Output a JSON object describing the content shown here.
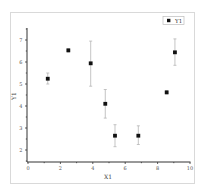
{
  "chart_data": {
    "type": "scatter",
    "title": "",
    "xlabel": "X1",
    "ylabel": "Y1",
    "xlim": [
      0,
      10
    ],
    "ylim": [
      1.5,
      7.5
    ],
    "xticks": [
      0,
      2,
      4,
      6,
      8,
      10
    ],
    "yticks": [
      2,
      3,
      4,
      5,
      6,
      7
    ],
    "grid": false,
    "legend_position": "top-right",
    "series": [
      {
        "name": "Y1",
        "marker": "square",
        "color": "#111111",
        "error_bar_color": "#b5b5b5",
        "points": [
          {
            "x": 1.22,
            "y": 5.24,
            "err_low": 5.0,
            "err_high": 5.5
          },
          {
            "x": 2.49,
            "y": 6.53,
            "err_low": 6.45,
            "err_high": 6.6
          },
          {
            "x": 3.87,
            "y": 5.94,
            "err_low": 4.9,
            "err_high": 6.95
          },
          {
            "x": 4.77,
            "y": 4.1,
            "err_low": 3.45,
            "err_high": 4.75
          },
          {
            "x": 5.37,
            "y": 2.65,
            "err_low": 2.15,
            "err_high": 3.15
          },
          {
            "x": 6.81,
            "y": 2.65,
            "err_low": 2.25,
            "err_high": 3.1
          },
          {
            "x": 8.56,
            "y": 4.62,
            "err_low": 4.55,
            "err_high": 4.7
          },
          {
            "x": 9.07,
            "y": 6.44,
            "err_low": 5.85,
            "err_high": 7.05
          }
        ]
      }
    ]
  },
  "axes": {
    "x_title": "X1",
    "y_title": "Y1",
    "x_tick_labels": [
      "0",
      "2",
      "4",
      "6",
      "8",
      "10"
    ],
    "y_tick_labels": [
      "2",
      "3",
      "4",
      "5",
      "6",
      "7"
    ]
  },
  "legend": {
    "entries": [
      {
        "label": "Y1",
        "marker": "square"
      }
    ]
  }
}
